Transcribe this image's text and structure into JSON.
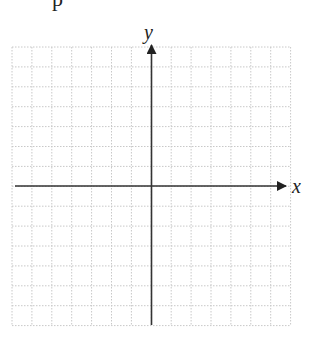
{
  "top_fragment": "p",
  "graph": {
    "x_label": "x",
    "y_label": "y",
    "grid": {
      "left": 12,
      "top": 47,
      "cell": 19.9,
      "cols": 14,
      "rows": 14,
      "line_color": "#c8c8c8",
      "style": "dotted"
    },
    "origin": {
      "x": 151.5,
      "y": 186
    },
    "axis_color": "#333333",
    "x_axis": {
      "start": 15,
      "end": 286
    },
    "y_axis": {
      "start": 325,
      "end": 45
    }
  },
  "chart_data": {
    "type": "scatter",
    "title": "",
    "xlabel": "x",
    "ylabel": "y",
    "xlim": [
      -7,
      7
    ],
    "ylim": [
      -7,
      7
    ],
    "grid": true,
    "series": [],
    "annotations": [
      "blank coordinate plane with 14x14 unit grid, axes through origin"
    ]
  }
}
